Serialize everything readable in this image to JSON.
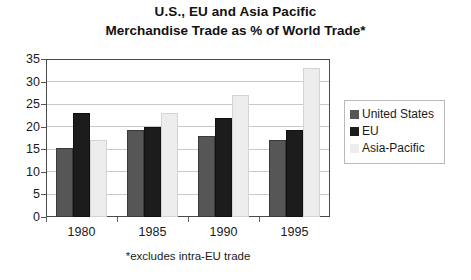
{
  "chart_data": {
    "type": "bar",
    "title": "U.S., EU and Asia Pacific Merchandise Trade as % of World Trade*",
    "title_line1": "U.S., EU and Asia Pacific",
    "title_line2": "Merchandise Trade as % of World Trade*",
    "footnote": "*excludes intra-EU trade",
    "xlabel": "",
    "ylabel": "",
    "categories": [
      "1980",
      "1985",
      "1990",
      "1995"
    ],
    "yticks": [
      0,
      5,
      10,
      15,
      20,
      25,
      30,
      35
    ],
    "ylim": [
      0,
      35
    ],
    "grid": true,
    "legend_position": "right",
    "series": [
      {
        "name": "United States",
        "color": "#565656",
        "values": [
          15.3,
          19.3,
          18.0,
          17.0
        ]
      },
      {
        "name": "EU",
        "color": "#1c1c1c",
        "values": [
          23.0,
          20.0,
          22.0,
          19.3
        ]
      },
      {
        "name": "Asia-Pacific",
        "color": "#ededed",
        "values": [
          17.0,
          23.0,
          27.0,
          33.0
        ]
      }
    ]
  }
}
